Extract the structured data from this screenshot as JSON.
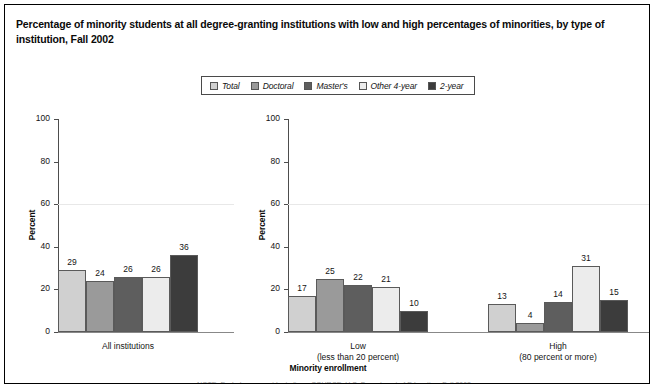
{
  "figure": {
    "title": "Percentage of minority students at all degree-granting institutions with low and high percentages of minorities, by type of institution, Fall 2002",
    "xaxis_title": "Minority enrollment",
    "clipped_footnote": "NOTE: Excludes nonresident aliens. SOURCE: U.S. Department of Education, Fall 2002."
  },
  "legend": {
    "items": [
      {
        "label": "Total",
        "color": "#d0d0d0"
      },
      {
        "label": "Doctoral",
        "color": "#9a9a9a"
      },
      {
        "label": "Master's",
        "color": "#5e5e5e"
      },
      {
        "label": "Other 4-year",
        "color": "#ececec"
      },
      {
        "label": "2-year",
        "color": "#3c3c3c"
      }
    ]
  },
  "chart_data": [
    {
      "type": "bar",
      "panel": "left",
      "title": "",
      "xlabel": "",
      "ylabel": "Percent",
      "ylim": [
        0,
        100
      ],
      "yticks": [
        0,
        20,
        40,
        60,
        80,
        100
      ],
      "grid": false,
      "legend_position": "top-center",
      "categories": [
        "All institutions"
      ],
      "groups": [
        {
          "label": "All institutions",
          "sublabel": "",
          "series": [
            {
              "name": "Total",
              "value": 29,
              "color": "#d0d0d0"
            },
            {
              "name": "Doctoral",
              "value": 24,
              "color": "#9a9a9a"
            },
            {
              "name": "Master's",
              "value": 26,
              "color": "#5e5e5e"
            },
            {
              "name": "Other 4-year",
              "value": 26,
              "color": "#ececec"
            },
            {
              "name": "2-year",
              "value": 36,
              "color": "#3c3c3c"
            }
          ]
        }
      ]
    },
    {
      "type": "bar",
      "panel": "right",
      "title": "",
      "xlabel": "Minority enrollment",
      "ylabel": "Percent",
      "ylim": [
        0,
        100
      ],
      "yticks": [
        0,
        20,
        40,
        60,
        80,
        100
      ],
      "grid": false,
      "legend_position": "top-center",
      "categories": [
        "Low (less than 20 percent)",
        "High (80 percent or more)"
      ],
      "groups": [
        {
          "label": "Low",
          "sublabel": "(less than 20 percent)",
          "series": [
            {
              "name": "Total",
              "value": 17,
              "color": "#d0d0d0"
            },
            {
              "name": "Doctoral",
              "value": 25,
              "color": "#9a9a9a"
            },
            {
              "name": "Master's",
              "value": 22,
              "color": "#5e5e5e"
            },
            {
              "name": "Other 4-year",
              "value": 21,
              "color": "#ececec"
            },
            {
              "name": "2-year",
              "value": 10,
              "color": "#3c3c3c"
            }
          ]
        },
        {
          "label": "High",
          "sublabel": "(80 percent or more)",
          "series": [
            {
              "name": "Total",
              "value": 13,
              "color": "#d0d0d0"
            },
            {
              "name": "Doctoral",
              "value": 4,
              "color": "#9a9a9a"
            },
            {
              "name": "Master's",
              "value": 14,
              "color": "#5e5e5e"
            },
            {
              "name": "Other 4-year",
              "value": 31,
              "color": "#ececec"
            },
            {
              "name": "2-year",
              "value": 15,
              "color": "#3c3c3c"
            }
          ]
        }
      ]
    }
  ]
}
